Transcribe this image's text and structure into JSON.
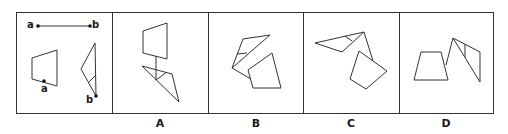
{
  "puzzle": {
    "reference": {
      "segment_labels": {
        "start": "a",
        "end": "b"
      },
      "shape_labels": {
        "quad_point": "a",
        "triangle_point": "b"
      }
    },
    "options": [
      {
        "label": "A"
      },
      {
        "label": "B"
      },
      {
        "label": "C"
      },
      {
        "label": "D"
      }
    ]
  }
}
